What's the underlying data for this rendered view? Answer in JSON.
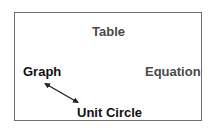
{
  "diagram": {
    "nodes": [
      {
        "id": "table",
        "label": "Table",
        "color": "#4a4a4a"
      },
      {
        "id": "graph",
        "label": "Graph",
        "color": "#111111"
      },
      {
        "id": "equation",
        "label": "Equation",
        "color": "#4a4a4a"
      },
      {
        "id": "unit_circle",
        "label": "Unit Circle",
        "color": "#111111"
      }
    ],
    "edges": [
      {
        "from": "graph",
        "to": "unit_circle",
        "type": "double-headed-arrow",
        "color": "#222222"
      }
    ],
    "frame_color": "#6f6f6f"
  }
}
